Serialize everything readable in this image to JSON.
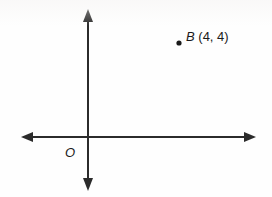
{
  "figure": {
    "type": "coordinate-plane-diagram",
    "background_color": "#fefefe",
    "line_color": "#2b2b2b",
    "text_color": "#1a1a1a"
  },
  "axes": {
    "x_axis": {
      "name": "horizontal-axis",
      "left_arrow": "arrow",
      "right_arrow": "arrow"
    },
    "y_axis": {
      "name": "vertical-axis",
      "top_arrow": "arrow",
      "bottom_arrow": "arrow"
    },
    "origin": {
      "label": "O",
      "x": 0,
      "y": 0
    }
  },
  "points": [
    {
      "name": "point-b",
      "label_name": "B",
      "coordinates_text": "(4, 4)",
      "x": 4,
      "y": 4,
      "marker": "filled-dot"
    }
  ],
  "icons": {
    "arrow_up": "arrow-up-icon",
    "arrow_down": "arrow-down-icon",
    "arrow_left": "arrow-left-icon",
    "arrow_right": "arrow-right-icon",
    "dot": "dot-icon"
  }
}
